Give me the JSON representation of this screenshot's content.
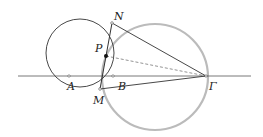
{
  "diagram": {
    "labels": {
      "N": "N",
      "P": "P",
      "A": "A",
      "B": "B",
      "M": "M",
      "Gamma": "Γ"
    },
    "colors": {
      "line": "#333333",
      "big_circle": "#bbbbbb",
      "dashed": "#666666"
    }
  }
}
